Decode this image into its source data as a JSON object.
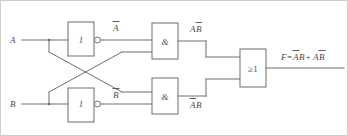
{
  "diagram": {
    "type": "logic-circuit-schematic",
    "inputs": [
      {
        "name": "A",
        "label": "A",
        "y": 40
      },
      {
        "name": "B",
        "label": "B",
        "y": 104
      }
    ],
    "gates": [
      {
        "id": "inv-a",
        "kind": "inverter",
        "label": "1",
        "inverted_output": true,
        "output_label": "Ā"
      },
      {
        "id": "inv-b",
        "kind": "inverter",
        "label": "1",
        "inverted_output": true,
        "output_label": "B̄"
      },
      {
        "id": "and-top",
        "kind": "and",
        "label": "&",
        "output_label": "AB̄"
      },
      {
        "id": "and-bottom",
        "kind": "and",
        "label": "&",
        "output_label": "ĀB"
      },
      {
        "id": "or-out",
        "kind": "or",
        "label": "≥1",
        "output_label": "F=ĀB+AB̄"
      }
    ],
    "labels": {
      "input_a": "A",
      "input_b": "B",
      "not_a": "A",
      "not_a_bar": true,
      "not_b": "B",
      "not_b_bar": true,
      "inverter_symbol": "1",
      "and_symbol": "&",
      "or_symbol": "≥1",
      "and_top_out_first": "A",
      "and_top_out_second": "B",
      "and_bottom_out_first": "A",
      "and_bottom_out_second": "B",
      "output_prefix": "F=",
      "output_term1_a": "A",
      "output_term1_b": "B",
      "output_plus": "+",
      "output_term2_a": "A",
      "output_term2_b": "B"
    },
    "colors": {
      "wire": "#6e6e6e",
      "text": "#4a4a4a",
      "frame": "#cfcfcf",
      "background": "#ffffff"
    }
  }
}
